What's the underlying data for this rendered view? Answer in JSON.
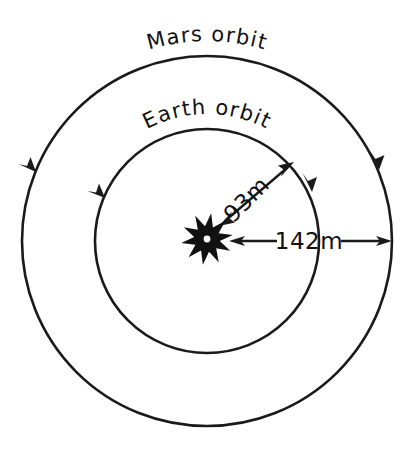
{
  "figure": {
    "type": "orbit-diagram",
    "background_color": "#ffffff",
    "ink_color": "#1a1a1a",
    "width": 416,
    "height": 452
  },
  "center_object": {
    "name": "sun",
    "label": "",
    "cx": 207,
    "cy": 239,
    "outer_radius": 26,
    "inner_radius": 13,
    "points": 10,
    "core_radius": 3.4,
    "fill": "#111111",
    "core_fill": "#ffffff"
  },
  "orbits": [
    {
      "id": "earth",
      "label": "Earth  orbit",
      "radius": 112,
      "stroke_width": 2.6,
      "direction": "counterclockwise",
      "label_arc_radius": 112,
      "label_offset": 13,
      "arrow_angles_deg": [
        208,
        332
      ]
    },
    {
      "id": "mars",
      "label": "Mars  orbit",
      "radius": 185,
      "stroke_width": 2.6,
      "direction": "counterclockwise",
      "label_arc_radius": 185,
      "label_offset": 13,
      "arrow_angles_deg": [
        201,
        339
      ]
    }
  ],
  "measurements": [
    {
      "id": "earth-distance",
      "value": "93m",
      "from": "sun",
      "to": "earth-orbit",
      "angle_deg": -45,
      "text_rotation_deg": -45,
      "arrow": "double",
      "text_x": 252,
      "text_y": 205
    },
    {
      "id": "mars-distance",
      "value": "142m",
      "from": "sun",
      "to": "mars-orbit",
      "angle_deg": 0,
      "text_rotation_deg": 0,
      "arrow": "double",
      "text_x": 308,
      "text_y": 247
    }
  ],
  "chart_data": {
    "type": "diagram",
    "items": [
      {
        "label": "Earth  orbit",
        "distance": "93m",
        "distance_value": 93,
        "unit": "million miles",
        "orbit_radius_px": 112
      },
      {
        "label": "Mars  orbit",
        "distance": "142m",
        "distance_value": 142,
        "unit": "million miles",
        "orbit_radius_px": 185
      }
    ],
    "center": "Sun",
    "annotations": [
      "Mars  orbit",
      "Earth  orbit",
      "93m",
      "142m"
    ]
  }
}
